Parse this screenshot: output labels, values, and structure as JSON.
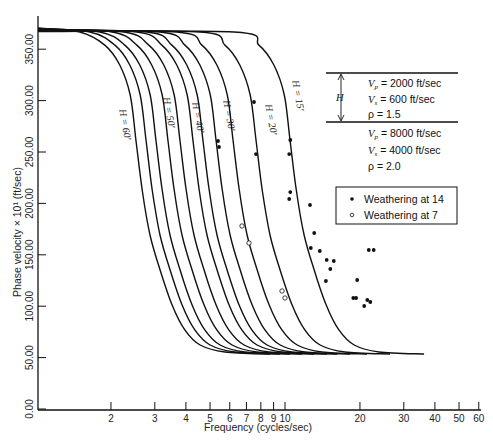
{
  "chart_data": {
    "type": "line",
    "title": "",
    "xlabel": "Frequency  (cycles/sec)",
    "ylabel": "Phase velocity × 10¹  (ft/sec)",
    "xscale": "log",
    "xlim": [
      1,
      60
    ],
    "ylim": [
      0,
      370
    ],
    "grid": false,
    "x_ticks": [
      2,
      3,
      4,
      5,
      6,
      7,
      8,
      9,
      10,
      20,
      30,
      40,
      50,
      60
    ],
    "y_ticks": [
      "0.00",
      "50.00",
      "100.00",
      "150.00",
      "200.00",
      "250.00",
      "300.00",
      "350.00"
    ],
    "base_curve": [
      [
        1.02,
        370.6
      ],
      [
        1.5,
        366.7
      ],
      [
        1.89,
        354
      ],
      [
        2.17,
        334.6
      ],
      [
        2.39,
        305.4
      ],
      [
        2.52,
        261.7
      ],
      [
        2.67,
        213
      ],
      [
        2.87,
        169.3
      ],
      [
        3.15,
        135.2
      ],
      [
        3.52,
        101.2
      ],
      [
        3.96,
        76.9
      ],
      [
        4.56,
        62.3
      ],
      [
        5.74,
        55.4
      ],
      [
        8.71,
        53.5
      ]
    ],
    "series": [
      {
        "name": "H = 60'",
        "freq_factor": 1.0,
        "label": "H = 60′",
        "label_pos": [
          122,
          125
        ]
      },
      {
        "name": "curve-2",
        "freq_factor": 1.097,
        "label": ""
      },
      {
        "name": "H = 50'",
        "freq_factor": 1.203,
        "label": "H = 50′",
        "label_pos": [
          166,
          113
        ]
      },
      {
        "name": "curve-4",
        "freq_factor": 1.344,
        "label": ""
      },
      {
        "name": "H = 40'",
        "freq_factor": 1.502,
        "label": "H = 40′",
        "label_pos": [
          195,
          118
        ]
      },
      {
        "name": "curve-6",
        "freq_factor": 1.694,
        "label": ""
      },
      {
        "name": "H = 30'",
        "freq_factor": 1.858,
        "label": "H = 30′",
        "label_pos": [
          226,
          116
        ]
      },
      {
        "name": "curve-8",
        "freq_factor": 2.097,
        "label": ""
      },
      {
        "name": "curve-9",
        "freq_factor": 2.454,
        "label": ""
      },
      {
        "name": "H = 20'",
        "freq_factor": 3.034,
        "label": "H = 20′",
        "label_pos": [
          268,
          120
        ]
      },
      {
        "name": "H = 15'",
        "freq_factor": 4.157,
        "label": "H = 15′",
        "label_pos": [
          295,
          96
        ]
      }
    ],
    "scatter": [
      {
        "name": "Weathering at 14",
        "marker": "filled",
        "points": [
          [
            7.51,
            298.6
          ],
          [
            7.65,
            248
          ],
          [
            10.5,
            261.7
          ],
          [
            10.4,
            248
          ],
          [
            5.38,
            260.7
          ],
          [
            5.43,
            254.9
          ],
          [
            10.5,
            211
          ],
          [
            10.4,
            204.3
          ],
          [
            12.6,
            198.4
          ],
          [
            13.1,
            171.2
          ],
          [
            12.7,
            156.6
          ],
          [
            13.8,
            153.7
          ],
          [
            14.7,
            145
          ],
          [
            15.7,
            144
          ],
          [
            15.2,
            136.2
          ],
          [
            14.6,
            124.5
          ],
          [
            19.5,
            125.5
          ],
          [
            19.3,
            108
          ],
          [
            18.8,
            108
          ],
          [
            21.4,
            106
          ],
          [
            22.0,
            104.1
          ],
          [
            20.8,
            100.2
          ],
          [
            21.7,
            154.7
          ],
          [
            22.7,
            154.7
          ]
        ]
      },
      {
        "name": "Weathering at 7",
        "marker": "open",
        "points": [
          [
            6.72,
            178
          ],
          [
            7.17,
            161.5
          ],
          [
            9.73,
            114.8
          ],
          [
            10.0,
            108
          ]
        ]
      }
    ],
    "legend": {
      "position": "right-middle",
      "entries": [
        {
          "marker": "filled",
          "label": "Weathering at 14"
        },
        {
          "marker": "open",
          "label": "Weathering at 7"
        }
      ]
    },
    "annotations": {
      "layer_marker": "H",
      "upper_layer": [
        "V_p = 2000 ft/sec",
        "V_s = 600 ft/sec",
        "ρ = 1.5"
      ],
      "lower_layer": [
        "V_p = 8000 ft/sec",
        "V_s = 4000 ft/sec",
        "ρ = 2.0"
      ]
    }
  },
  "legend": {
    "filled_label": "Weathering at 14",
    "open_label": "Weathering at 7"
  },
  "model": {
    "h_label": "H",
    "upper": {
      "vp_sym": "V",
      "vp_sub": "p",
      "vp_val": "= 2000  ft/sec",
      "vs_sym": "V",
      "vs_sub": "s",
      "vs_val": "=  600  ft/sec",
      "rho": "ρ =  1.5"
    },
    "lower": {
      "vp_sym": "V",
      "vp_sub": "p",
      "vp_val": "=  8000  ft/sec",
      "vs_sym": "V",
      "vs_sub": "s",
      "vs_val": "=  4000  ft/sec",
      "rho": "ρ = 2.0"
    }
  },
  "axes": {
    "xlabel": "Frequency  (cycles/sec)",
    "ylabel": "Phase velocity × 10¹  (ft/sec)"
  }
}
